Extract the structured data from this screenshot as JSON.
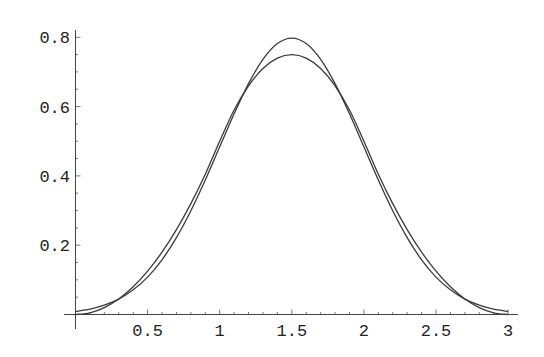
{
  "chart_data": {
    "type": "line",
    "title": "",
    "xlabel": "",
    "ylabel": "",
    "xlim": [
      0,
      3
    ],
    "ylim": [
      0,
      0.8
    ],
    "grid": false,
    "legend": null,
    "x_ticks": [
      0.5,
      1,
      1.5,
      2,
      2.5,
      3
    ],
    "x_tick_labels": [
      "0.5",
      "1",
      "1.5",
      "2",
      "2.5",
      "3"
    ],
    "y_ticks": [
      0.2,
      0.4,
      0.6,
      0.8
    ],
    "y_tick_labels": [
      "0.2",
      "0.4",
      "0.6",
      "0.8"
    ],
    "x": [
      0,
      0.1,
      0.2,
      0.3,
      0.4,
      0.5,
      0.6,
      0.7,
      0.8,
      0.9,
      1.0,
      1.1,
      1.2,
      1.3,
      1.4,
      1.5,
      1.6,
      1.7,
      1.8,
      1.9,
      2.0,
      2.1,
      2.2,
      2.3,
      2.4,
      2.5,
      2.6,
      2.7,
      2.8,
      2.9,
      3.0
    ],
    "series": [
      {
        "name": "curve-lower-peak",
        "values": [
          0,
          0.005,
          0.02,
          0.045,
          0.08,
          0.125,
          0.18,
          0.245,
          0.32,
          0.405,
          0.5,
          0.59,
          0.66,
          0.71,
          0.74,
          0.75,
          0.74,
          0.71,
          0.66,
          0.59,
          0.5,
          0.405,
          0.32,
          0.245,
          0.18,
          0.125,
          0.08,
          0.045,
          0.02,
          0.005,
          0
        ]
      },
      {
        "name": "curve-higher-peak",
        "values": [
          0.0089,
          0.0155,
          0.0269,
          0.0443,
          0.0712,
          0.108,
          0.1579,
          0.2218,
          0.2995,
          0.3884,
          0.4839,
          0.5794,
          0.6664,
          0.7365,
          0.7821,
          0.7979,
          0.7821,
          0.7365,
          0.6664,
          0.5794,
          0.4839,
          0.3884,
          0.2995,
          0.2218,
          0.1579,
          0.108,
          0.0712,
          0.0443,
          0.0269,
          0.0155,
          0.0089
        ]
      }
    ],
    "line_color": "#3a3a3a"
  }
}
